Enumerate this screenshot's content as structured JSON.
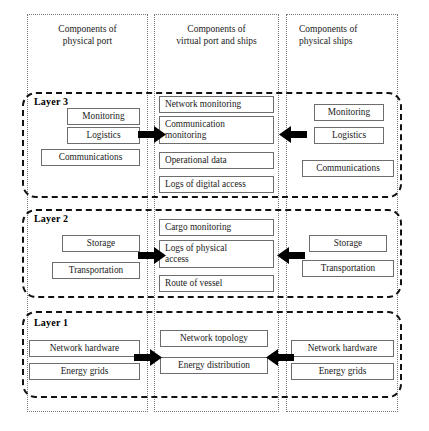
{
  "diagram": {
    "columns": [
      {
        "id": "physical-port",
        "header": "Components of\nphysical port"
      },
      {
        "id": "virtual-port",
        "header": "Components of\nvirtual port and ships"
      },
      {
        "id": "physical-ships",
        "header": "Components of\nphysical ships"
      }
    ],
    "column_headers": {
      "col1_line1": "Components of",
      "col1_line2": "physical port",
      "col2_line1": "Components of",
      "col2_line2": "virtual port and ships",
      "col3_line1": "Components of",
      "col3_line2": "physical ships"
    },
    "layers": [
      {
        "id": "layer-3",
        "label": "Layer 3",
        "left_items": [
          "Monitoring",
          "Logistics",
          "Communications"
        ],
        "middle_items": [
          "Network monitoring",
          "Communication monitoring",
          "Operational data",
          "Logs of digital access"
        ],
        "right_items": [
          "Monitoring",
          "Logistics",
          "Communications"
        ],
        "arrow_left_to_middle": "right-arrow",
        "arrow_right_to_middle": "left-arrow"
      },
      {
        "id": "layer-2",
        "label": "Layer 2",
        "left_items": [
          "Storage",
          "Transportation"
        ],
        "middle_items": [
          "Cargo monitoring",
          "Logs of physical access",
          "Route of vessel"
        ],
        "right_items": [
          "Storage",
          "Transportation"
        ],
        "arrow_left_to_middle": "right-arrow",
        "arrow_right_to_middle": "left-arrow"
      },
      {
        "id": "layer-1",
        "label": "Layer 1",
        "left_items": [
          "Network hardware",
          "Energy grids"
        ],
        "middle_items": [
          "Network topology",
          "Energy distribution"
        ],
        "right_items": [
          "Network hardware",
          "Energy grids"
        ],
        "arrow_left_to_middle": "right-arrow",
        "arrow_right_to_middle": "left-arrow"
      }
    ],
    "labels": {
      "layer3": "Layer 3",
      "layer2": "Layer 2",
      "layer1": "Layer 1"
    },
    "items": {
      "l3_left_1": "Monitoring",
      "l3_left_2": "Logistics",
      "l3_left_3": "Communications",
      "l3_mid_1": "Network monitoring",
      "l3_mid_2a": "Communication",
      "l3_mid_2b": "monitoring",
      "l3_mid_3": "Operational data",
      "l3_mid_4": "Logs of digital access",
      "l3_right_1": "Monitoring",
      "l3_right_2": "Logistics",
      "l3_right_3": "Communications",
      "l2_left_1": "Storage",
      "l2_left_2": "Transportation",
      "l2_mid_1": "Cargo monitoring",
      "l2_mid_2a": "Logs of physical",
      "l2_mid_2b": "access",
      "l2_mid_3": "Route of vessel",
      "l2_right_1": "Storage",
      "l2_right_2": "Transportation",
      "l1_left_1": "Network hardware",
      "l1_left_2": "Energy grids",
      "l1_mid_1": "Network topology",
      "l1_mid_2": "Energy distribution",
      "l1_right_1": "Network hardware",
      "l1_right_2": "Energy grids"
    },
    "colors": {
      "background": "#ffffff",
      "item_border": "#6d6d6d",
      "layer_border": "#111111",
      "column_border": "#7a7a7a",
      "arrow_fill": "#000000",
      "text": "#1a1a1a"
    }
  }
}
